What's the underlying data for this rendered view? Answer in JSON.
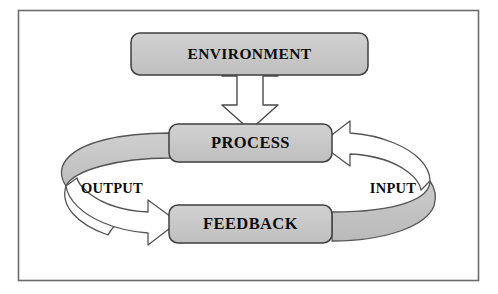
{
  "diagram": {
    "frame": {
      "border_color": "#5a5a5a",
      "background_color": "#ffffff"
    },
    "palette": {
      "box_fill": "#c8c8c8",
      "box_stroke": "#3a3a3a",
      "arrow_fill_white": "#ffffff",
      "arrow_fill_gray": "#c4c4c4",
      "arrow_stroke": "#4a4a4a",
      "text_color": "#0d0d0d"
    },
    "nodes": [
      {
        "id": "environment",
        "label": "ENVIRONMENT"
      },
      {
        "id": "process",
        "label": "PROCESS"
      },
      {
        "id": "feedback",
        "label": "FEEDBACK"
      }
    ],
    "connectors": [
      {
        "id": "env-process",
        "label": "",
        "kind": "double-headed-vertical-arrow",
        "from": "environment",
        "to": "process",
        "bidirectional": true,
        "fill": "white"
      },
      {
        "id": "output",
        "label": "OUTPUT",
        "kind": "curved-3d-arrow",
        "from": "process",
        "to": "feedback",
        "direction": "counterclockwise-left",
        "bidirectional": false,
        "fill": "gray-and-white"
      },
      {
        "id": "input",
        "label": "INPUT",
        "kind": "curved-3d-arrow",
        "from": "feedback",
        "to": "process",
        "direction": "counterclockwise-right",
        "bidirectional": false,
        "fill": "gray-and-white"
      }
    ]
  }
}
